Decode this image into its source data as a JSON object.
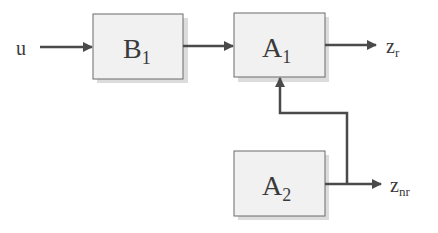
{
  "diagram": {
    "type": "block-diagram",
    "input": {
      "label": "u"
    },
    "blocks": [
      {
        "id": "B1",
        "main": "B",
        "sub": "1"
      },
      {
        "id": "A1",
        "main": "A",
        "sub": "1"
      },
      {
        "id": "A2",
        "main": "A",
        "sub": "2"
      }
    ],
    "outputs": [
      {
        "id": "zr",
        "main": "z",
        "sub": "r"
      },
      {
        "id": "znr",
        "main": "z",
        "sub": "nr"
      }
    ],
    "connections": [
      {
        "from": "u",
        "to": "B1"
      },
      {
        "from": "B1",
        "to": "A1"
      },
      {
        "from": "A1",
        "to": "zr"
      },
      {
        "from": "A2",
        "to": "znr"
      },
      {
        "from": "A2",
        "to": "A1",
        "note": "feedback branch into bottom of A1"
      }
    ],
    "colors": {
      "box_fill": "#f1f1f1",
      "box_stroke": "#6a6a6a",
      "wire": "#4a4a4a",
      "text": "#3a3a3a"
    }
  }
}
